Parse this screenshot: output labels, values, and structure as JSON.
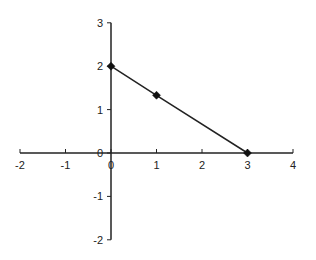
{
  "chart_data": {
    "type": "line",
    "title": "",
    "xlabel": "",
    "ylabel": "",
    "xlim": [
      -2,
      4
    ],
    "ylim": [
      -2,
      3
    ],
    "x_ticks": [
      -2,
      -1,
      0,
      1,
      2,
      3,
      4
    ],
    "y_ticks": [
      -2,
      -1,
      0,
      1,
      2,
      3
    ],
    "x_tick_labels": [
      "-2",
      "-1",
      "0",
      "1",
      "2",
      "3",
      "4"
    ],
    "y_tick_labels": [
      "-2",
      "-1",
      "0",
      "1",
      "2",
      "3"
    ],
    "grid": false,
    "legend": null,
    "series": [
      {
        "name": "series-1",
        "x": [
          0,
          1,
          3
        ],
        "y": [
          2,
          1.33,
          0
        ],
        "marker": "diamond",
        "color": "#222222"
      }
    ]
  },
  "layout": {
    "axis_color": "#222222",
    "line_color": "#222222",
    "marker_color": "#111111"
  }
}
